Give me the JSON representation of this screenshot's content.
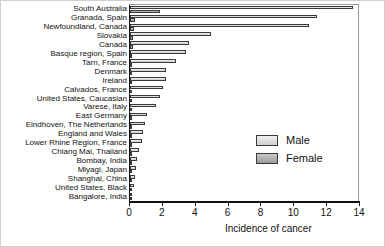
{
  "chart_data": {
    "type": "bar",
    "orientation": "horizontal",
    "title": "",
    "xlabel": "Incidence of cancer",
    "ylabel": "",
    "xlim": [
      0,
      14
    ],
    "xticks": [
      0,
      2,
      4,
      6,
      8,
      10,
      12,
      14
    ],
    "grid": false,
    "legend_position": "center-right",
    "categories": [
      "South Australia",
      "Granada, Spain",
      "Newfoundland, Canada",
      "Slovakia",
      "Canada",
      "Basque region, Spain",
      "Tarn, France",
      "Denmark",
      "Ireland",
      "Calvados, France",
      "United States, Caucasian",
      "Varese, Italy",
      "East Germany",
      "Eindhoven, The Netherlands",
      "England and Wales",
      "Lower Rhine Region, France",
      "Chiang Mai, Thailand",
      "Bombay, India",
      "Miyagi, Japan",
      "Shanghai, China",
      "United States, Black",
      "Bangalore, India"
    ],
    "series": [
      {
        "name": "Male",
        "color": "#dcdcdc",
        "values": [
          13.6,
          11.4,
          10.9,
          4.9,
          3.6,
          3.4,
          2.8,
          2.2,
          2.2,
          2.0,
          1.8,
          1.6,
          1.05,
          0.9,
          0.8,
          0.7,
          0.55,
          0.45,
          0.35,
          0.3,
          0.25,
          0.15
        ]
      },
      {
        "name": "Female",
        "color": "#a8a8a8",
        "values": [
          1.8,
          0.3,
          0.25,
          0.2,
          0.2,
          0.15,
          0.15,
          0.12,
          0.12,
          0.1,
          0.1,
          0.1,
          0.1,
          0.08,
          0.08,
          0.08,
          0.06,
          0.06,
          0.05,
          0.05,
          0.05,
          0.04
        ]
      }
    ]
  },
  "legend": {
    "male_label": "Male",
    "female_label": "Female"
  },
  "axis": {
    "x_title": "Incidence of cancer"
  }
}
